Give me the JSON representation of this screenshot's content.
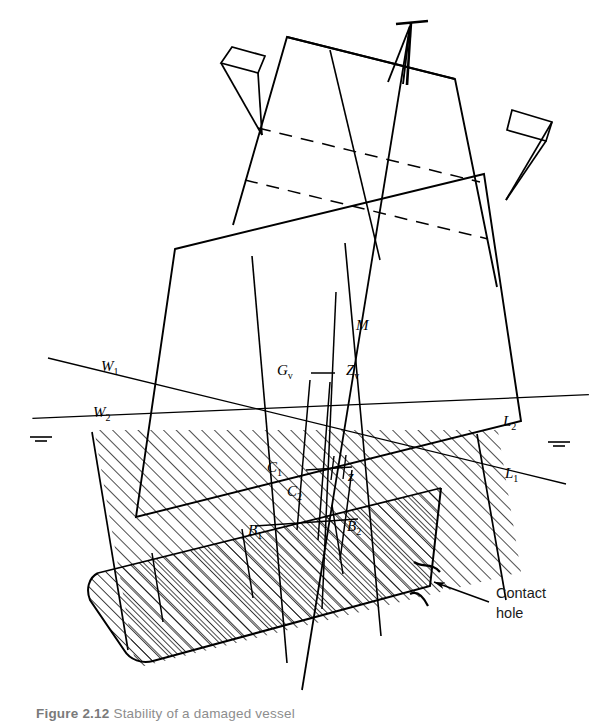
{
  "figure": {
    "domain_kind": "engineering-line-diagram",
    "background_color": "#ffffff",
    "line_color": "#000000",
    "hatch_color": "#1a1a1a",
    "heel_angle_degrees": -14
  },
  "labels": {
    "metacentre": {
      "base": "M",
      "sub": ""
    },
    "centre_of_gravity": {
      "base": "G",
      "sub": "v"
    },
    "righting_point": {
      "base": "Z",
      "sub": "v"
    },
    "waterline_upright_port": {
      "base": "W",
      "sub": "1"
    },
    "waterline_heeled_port": {
      "base": "W",
      "sub": "2"
    },
    "waterline_upright_stbd": {
      "base": "L",
      "sub": "1"
    },
    "waterline_heeled_stbd": {
      "base": "L",
      "sub": "2"
    },
    "centroid_one": {
      "base": "C",
      "sub": "1"
    },
    "centroid_two": {
      "base": "C",
      "sub": "2"
    },
    "buoyancy_one": {
      "base": "B",
      "sub": "1"
    },
    "buoyancy_two": {
      "base": "B",
      "sub": "2"
    },
    "shift_distance": {
      "base": "z",
      "sub": ""
    }
  },
  "annotations": {
    "contact_hole": {
      "line_one": "Contact",
      "line_two": "hole",
      "arrow": "leader-arrow-pointing-left"
    }
  },
  "caption": {
    "prefix": "Figure",
    "number": "2.12",
    "text": "Stability of a damaged vessel",
    "clipped": true
  },
  "symbols": {
    "water_level_port": "free-surface-level-symbol",
    "water_level_starboard": "free-surface-level-symbol",
    "mast": "mast-with-crossbar"
  }
}
